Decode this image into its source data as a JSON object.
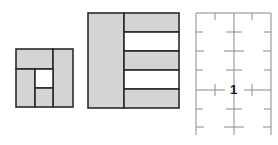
{
  "colors": {
    "panel_fill": "#d4d4d4",
    "line": "#2a2a2a",
    "grid_line": "#8a8a8a",
    "background": "#ffffff"
  },
  "figure1": {
    "description": "small square frame with four gray panels around a white square opening",
    "panels": [
      {
        "name": "top",
        "x": 16,
        "y": 49,
        "w": 37,
        "h": 20,
        "fill": "gray"
      },
      {
        "name": "right",
        "x": 53,
        "y": 49,
        "w": 20,
        "h": 58,
        "fill": "gray"
      },
      {
        "name": "bottom-left",
        "x": 16,
        "y": 69,
        "w": 19,
        "h": 38,
        "fill": "gray"
      },
      {
        "name": "opening",
        "x": 35,
        "y": 69,
        "w": 18,
        "h": 19,
        "fill": "white"
      },
      {
        "name": "bottom-center",
        "x": 35,
        "y": 88,
        "w": 18,
        "h": 19,
        "fill": "gray"
      }
    ]
  },
  "figure2": {
    "description": "tall rectangle with a full-height left panel and five horizontal strips alternating gray and white",
    "left_panel": {
      "x": 88,
      "y": 13,
      "w": 36,
      "h": 95
    },
    "strips": [
      {
        "y": 13,
        "h": 19,
        "fill": "gray"
      },
      {
        "y": 32,
        "h": 19,
        "fill": "white"
      },
      {
        "y": 51,
        "h": 19,
        "fill": "gray"
      },
      {
        "y": 70,
        "h": 19,
        "fill": "white"
      },
      {
        "y": 89,
        "h": 19,
        "fill": "gray"
      }
    ]
  },
  "figure3": {
    "description": "layout grid with three vertical lines, top border, and cross tick marks",
    "label": "1",
    "vertical_lines_x": [
      196,
      234,
      271
    ],
    "top_y": 13,
    "bottom_y": 135,
    "tick_rows_y": [
      32,
      51,
      70,
      90,
      109,
      127
    ]
  }
}
